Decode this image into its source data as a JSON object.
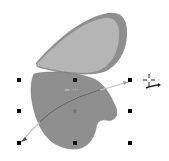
{
  "canvas": {
    "background": "#ffffff",
    "width": 169,
    "height": 161
  },
  "shapes": {
    "upper_leaf": {
      "name": "upper-leaf-shape",
      "fill": "#b5b5b5",
      "rim_fill": "#8e8e8e",
      "selected": false
    },
    "lower_heart": {
      "name": "lower-heart-shape",
      "fill": "#8f8f8f",
      "outline": "#7d7d7d",
      "selected": true
    }
  },
  "selection": {
    "handle_color": "#000000",
    "handles": [
      {
        "id": "top-left",
        "x": 19,
        "y": 80
      },
      {
        "id": "top-middle",
        "x": 75,
        "y": 80
      },
      {
        "id": "top-right",
        "x": 130,
        "y": 80
      },
      {
        "id": "middle-left",
        "x": 19,
        "y": 111
      },
      {
        "id": "middle-right",
        "x": 130,
        "y": 111
      },
      {
        "id": "bottom-left",
        "x": 19,
        "y": 143
      },
      {
        "id": "bottom-middle",
        "x": 75,
        "y": 143
      },
      {
        "id": "bottom-right",
        "x": 130,
        "y": 143
      }
    ],
    "center": {
      "x": 75,
      "y": 111,
      "color": "#6f6f6f"
    }
  },
  "guide_curve": {
    "stroke": "#5e5e5e",
    "light_stroke": "#bdbdbd",
    "start": {
      "x": 21,
      "y": 142
    },
    "end": {
      "x": 128,
      "y": 82
    }
  },
  "ghost_label": {
    "text": "≈ ···",
    "color": "#cfcfcf"
  },
  "cursor": {
    "type": "crosshair-with-curve-arrow",
    "x": 149,
    "y": 80,
    "color": "#222222"
  }
}
